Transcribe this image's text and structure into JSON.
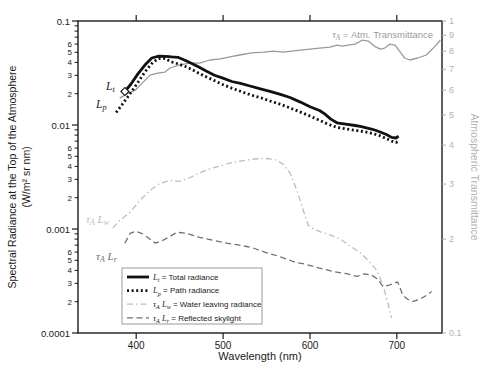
{
  "figure": {
    "background": "#ffffff",
    "axis_color": "#1a1a1a",
    "right_axis_text_color": "#b3b3b3"
  },
  "axes": {
    "x": {
      "title": "Wavelength (nm)",
      "range": [
        333,
        752
      ],
      "ticks": [
        400,
        500,
        600,
        700
      ],
      "tick_labels": [
        "400",
        "500",
        "600",
        "700"
      ]
    },
    "y_left": {
      "title_line1": "Spectral Radiance at the Top of the Atmosphere",
      "title_line2": "(W/m² sr nm)",
      "range": [
        0.0001,
        0.1
      ],
      "scale": "log",
      "decades": [
        0.1,
        0.01,
        0.001,
        0.0001
      ],
      "decade_labels": [
        "0.1",
        "0.01",
        "0.001",
        "0.0001"
      ],
      "minor_label_values": [
        6,
        5,
        4,
        3,
        2
      ]
    },
    "y_right": {
      "title": "Atmospheric Transmittance",
      "range": [
        0.1,
        1
      ],
      "scale": "log",
      "values": [
        1,
        0.9,
        0.8,
        0.7,
        0.6,
        0.5,
        0.4,
        0.3,
        0.2,
        0.1
      ],
      "labels": [
        "1",
        "9",
        "8",
        "7",
        "6",
        "5",
        "4",
        "3",
        "2",
        "0.1"
      ],
      "color": "#b3b3b3"
    }
  },
  "annotations": [
    {
      "id": "tau-annotation",
      "text": "τ_A = Atm. Transmittance",
      "x": 433,
      "y": 38,
      "anchor": "end",
      "color": "#9a9a9a",
      "math_size": 10,
      "sans_size": 9.5
    },
    {
      "id": "label-total-radiance",
      "text": "L_t",
      "x": 106,
      "y": 90,
      "anchor": "start",
      "color": "#1a1a1a",
      "math_size": 11.5,
      "sans_size": 10
    },
    {
      "id": "label-path-radiance",
      "text": "L_p",
      "x": 96,
      "y": 108,
      "anchor": "start",
      "color": "#1a1a1a",
      "math_size": 11.5,
      "sans_size": 10
    },
    {
      "id": "label-water-leaving",
      "text": "τ_A L_w",
      "x": 86,
      "y": 223,
      "anchor": "start",
      "color": "#bdbdbd",
      "math_size": 11,
      "sans_size": 10
    },
    {
      "id": "label-reflected-skylight",
      "text": "τ_A L_r",
      "x": 96,
      "y": 260,
      "anchor": "start",
      "color": "#707070",
      "math_size": 11,
      "sans_size": 10
    }
  ],
  "legend": {
    "x": 122,
    "y": 268,
    "width": 140,
    "height": 56,
    "border_color": "#999999",
    "entries": [
      {
        "id": "total-radiance",
        "label": "L_t = Total radiance",
        "color": "#111111",
        "line_width": 2.8,
        "dash": ""
      },
      {
        "id": "path-radiance",
        "label": "L_p = Path radiance",
        "color": "#111111",
        "line_width": 2.8,
        "dash": "2 2.6"
      },
      {
        "id": "water-leaving-radiance",
        "label": "τ_A L_w = Water leaving radiance",
        "color": "#bdbdbd",
        "line_width": 1.3,
        "dash": "6 3 1.5 3"
      },
      {
        "id": "reflected-skylight",
        "label": "τ_A L_r = Reflected skylight",
        "color": "#707070",
        "line_width": 1.3,
        "dash": "6 3.5"
      }
    ]
  },
  "chart_data": {
    "type": "line",
    "title": "",
    "xlabel": "Wavelength (nm)",
    "ylabel_left": "Spectral Radiance at the Top of the Atmosphere (W/m² sr nm)",
    "ylabel_right": "Atmospheric Transmittance",
    "x_range": [
      333,
      752
    ],
    "y_left_range": [
      0.0001,
      0.1
    ],
    "y_right_range": [
      0.1,
      1
    ],
    "grid": false,
    "legend_position": "bottom-center-inside",
    "marker": {
      "series": "total-radiance",
      "point": [
        387,
        0.021
      ],
      "shape": "open-diamond"
    },
    "series": [
      {
        "id": "water-leaving-radiance",
        "name": "τ_A L_w = Water leaving radiance",
        "axis": "left",
        "color": "#bdbdbd",
        "width": 1.3,
        "dash": "6 3 1.5 3",
        "points": [
          [
            373,
            0.00102
          ],
          [
            381,
            0.00121
          ],
          [
            393,
            0.00145
          ],
          [
            404,
            0.00188
          ],
          [
            416,
            0.00235
          ],
          [
            427,
            0.00274
          ],
          [
            439,
            0.00293
          ],
          [
            450,
            0.00287
          ],
          [
            462,
            0.00313
          ],
          [
            473,
            0.00347
          ],
          [
            485,
            0.00379
          ],
          [
            497,
            0.00404
          ],
          [
            508,
            0.00431
          ],
          [
            520,
            0.00449
          ],
          [
            533,
            0.00468
          ],
          [
            547,
            0.00478
          ],
          [
            559,
            0.00468
          ],
          [
            569,
            0.00422
          ],
          [
            577,
            0.00347
          ],
          [
            585,
            0.00235
          ],
          [
            593,
            0.00145
          ],
          [
            598,
            0.00109
          ],
          [
            604,
            0.001
          ],
          [
            612,
            0.00094
          ],
          [
            623,
            0.00088
          ],
          [
            635,
            0.0008
          ],
          [
            646,
            0.00069
          ],
          [
            658,
            0.00059
          ],
          [
            669,
            0.00048
          ],
          [
            677,
            0.0004
          ],
          [
            684,
            0.00029
          ],
          [
            690,
            0.00019
          ],
          [
            694,
            0.00014
          ]
        ]
      },
      {
        "id": "reflected-skylight",
        "name": "τ_A L_r = Reflected skylight",
        "axis": "left",
        "color": "#707070",
        "width": 1.3,
        "dash": "6 3.5",
        "points": [
          [
            387,
            0.00073
          ],
          [
            393,
            0.00091
          ],
          [
            400,
            0.00095
          ],
          [
            406,
            0.00091
          ],
          [
            414,
            0.00082
          ],
          [
            422,
            0.00073
          ],
          [
            431,
            0.00078
          ],
          [
            439,
            0.00085
          ],
          [
            447,
            0.00093
          ],
          [
            458,
            0.00091
          ],
          [
            473,
            0.00083
          ],
          [
            488,
            0.00078
          ],
          [
            504,
            0.00073
          ],
          [
            519,
            0.0007
          ],
          [
            534,
            0.00066
          ],
          [
            548,
            0.0006
          ],
          [
            566,
            0.00054
          ],
          [
            583,
            0.00048
          ],
          [
            594,
            0.00046
          ],
          [
            611,
            0.00042
          ],
          [
            627,
            0.00039
          ],
          [
            643,
            0.00037
          ],
          [
            654,
            0.00035
          ],
          [
            663,
            0.00037
          ],
          [
            671,
            0.00036
          ],
          [
            678,
            0.00033
          ],
          [
            684,
            0.00028
          ],
          [
            692,
            0.00029
          ],
          [
            701,
            0.00031
          ],
          [
            707,
            0.00023
          ],
          [
            713,
            0.00021
          ],
          [
            718,
            0.0002
          ],
          [
            726,
            0.00021
          ],
          [
            734,
            0.00023
          ],
          [
            740,
            0.00025
          ]
        ]
      },
      {
        "id": "atm-transmittance",
        "name": "τ_A = Atm. Transmittance",
        "axis": "right",
        "color": "#9a9a9a",
        "width": 1.3,
        "dash": "",
        "points": [
          [
            381,
            0.566
          ],
          [
            391,
            0.588
          ],
          [
            399,
            0.6
          ],
          [
            408,
            0.637
          ],
          [
            416,
            0.671
          ],
          [
            425,
            0.681
          ],
          [
            433,
            0.686
          ],
          [
            439,
            0.707
          ],
          [
            450,
            0.723
          ],
          [
            462,
            0.733
          ],
          [
            473,
            0.733
          ],
          [
            485,
            0.75
          ],
          [
            497,
            0.756
          ],
          [
            508,
            0.767
          ],
          [
            519,
            0.778
          ],
          [
            533,
            0.79
          ],
          [
            547,
            0.795
          ],
          [
            558,
            0.801
          ],
          [
            569,
            0.795
          ],
          [
            579,
            0.801
          ],
          [
            589,
            0.807
          ],
          [
            600,
            0.813
          ],
          [
            611,
            0.819
          ],
          [
            623,
            0.825
          ],
          [
            631,
            0.837
          ],
          [
            637,
            0.831
          ],
          [
            644,
            0.837
          ],
          [
            652,
            0.843
          ],
          [
            660,
            0.868
          ],
          [
            667,
            0.862
          ],
          [
            674,
            0.831
          ],
          [
            681,
            0.813
          ],
          [
            686,
            0.819
          ],
          [
            692,
            0.843
          ],
          [
            698,
            0.837
          ],
          [
            704,
            0.795
          ],
          [
            709,
            0.761
          ],
          [
            715,
            0.75
          ],
          [
            724,
            0.761
          ],
          [
            734,
            0.778
          ],
          [
            743,
            0.825
          ],
          [
            750,
            0.868
          ]
        ]
      },
      {
        "id": "path-radiance",
        "name": "L_p = Path radiance",
        "axis": "left",
        "color": "#111111",
        "width": 2.8,
        "dash": "2 2.6",
        "points": [
          [
            377,
            0.0132
          ],
          [
            384,
            0.0158
          ],
          [
            391,
            0.019
          ],
          [
            398,
            0.023
          ],
          [
            405,
            0.028
          ],
          [
            412,
            0.034
          ],
          [
            419,
            0.04
          ],
          [
            426,
            0.0436
          ],
          [
            433,
            0.0436
          ],
          [
            440,
            0.0405
          ],
          [
            448,
            0.0388
          ],
          [
            456,
            0.0367
          ],
          [
            464,
            0.0342
          ],
          [
            472,
            0.0315
          ],
          [
            480,
            0.0292
          ],
          [
            490,
            0.0267
          ],
          [
            499,
            0.0246
          ],
          [
            510,
            0.0226
          ],
          [
            520,
            0.0211
          ],
          [
            531,
            0.0196
          ],
          [
            543,
            0.0183
          ],
          [
            554,
            0.017
          ],
          [
            566,
            0.0158
          ],
          [
            577,
            0.0146
          ],
          [
            589,
            0.0133
          ],
          [
            600,
            0.0122
          ],
          [
            611,
            0.0111
          ],
          [
            622,
            0.0101
          ],
          [
            631,
            0.0095
          ],
          [
            641,
            0.0092
          ],
          [
            652,
            0.0089
          ],
          [
            663,
            0.0086
          ],
          [
            672,
            0.0083
          ],
          [
            680,
            0.0079
          ],
          [
            688,
            0.0074
          ],
          [
            694,
            0.007
          ],
          [
            699,
            0.0068
          ],
          [
            702,
            0.007
          ]
        ]
      },
      {
        "id": "total-radiance",
        "name": "L_t = Total radiance",
        "axis": "left",
        "color": "#111111",
        "width": 2.8,
        "dash": "",
        "points": [
          [
            387,
            0.021
          ],
          [
            394,
            0.0248
          ],
          [
            402,
            0.031
          ],
          [
            410,
            0.0377
          ],
          [
            418,
            0.0441
          ],
          [
            426,
            0.046
          ],
          [
            434,
            0.0458
          ],
          [
            441,
            0.0452
          ],
          [
            448,
            0.0448
          ],
          [
            456,
            0.042
          ],
          [
            464,
            0.039
          ],
          [
            472,
            0.036
          ],
          [
            480,
            0.0332
          ],
          [
            490,
            0.0301
          ],
          [
            499,
            0.0284
          ],
          [
            510,
            0.0262
          ],
          [
            520,
            0.0251
          ],
          [
            531,
            0.0237
          ],
          [
            543,
            0.0223
          ],
          [
            554,
            0.0211
          ],
          [
            566,
            0.0197
          ],
          [
            577,
            0.0184
          ],
          [
            589,
            0.0166
          ],
          [
            600,
            0.015
          ],
          [
            611,
            0.0138
          ],
          [
            617,
            0.0128
          ],
          [
            624,
            0.0114
          ],
          [
            631,
            0.0105
          ],
          [
            641,
            0.0102
          ],
          [
            652,
            0.0099
          ],
          [
            658,
            0.0097
          ],
          [
            665,
            0.0094
          ],
          [
            672,
            0.0091
          ],
          [
            680,
            0.0086
          ],
          [
            688,
            0.0081
          ],
          [
            694,
            0.0076
          ],
          [
            699,
            0.0075
          ],
          [
            702,
            0.0078
          ]
        ]
      }
    ]
  }
}
